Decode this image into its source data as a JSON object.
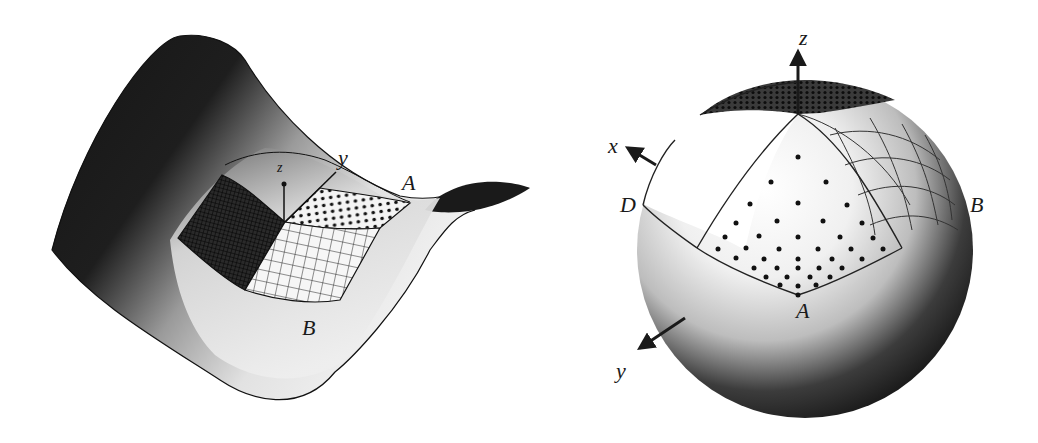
{
  "figures": [
    {
      "id": "saddle",
      "description": "Saddle (hyperbolic paraboloid) surface with grid patches and local axes",
      "labels": {
        "z_axis": "z",
        "y_axis": "y",
        "point_a": "A",
        "point_b": "B"
      }
    },
    {
      "id": "sphere",
      "description": "Sphere with spherical triangle of dots, gridded patch and coordinate axes",
      "labels": {
        "z_axis": "z",
        "x_axis": "x",
        "y_axis": "y",
        "point_a": "A",
        "point_b": "B",
        "point_d": "D"
      }
    }
  ],
  "colors": {
    "background": "#ffffff",
    "surface_dark": "#1c1c1c",
    "surface_light": "#f2f2f2",
    "ink": "#1a1a1a"
  }
}
